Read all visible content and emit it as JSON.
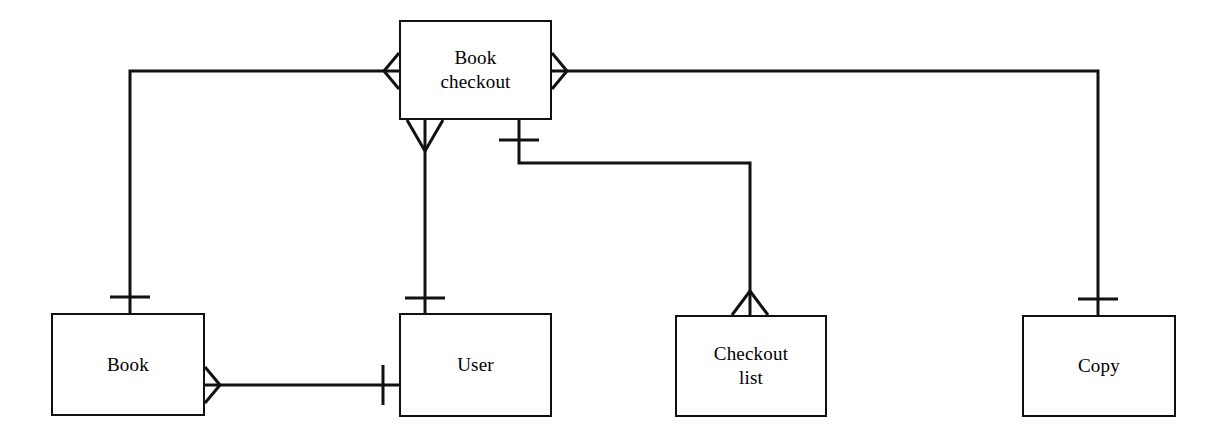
{
  "diagram": {
    "type": "entity-relationship-diagram",
    "notation": "crow's foot",
    "canvas": {
      "width": 1221,
      "height": 444,
      "background": "#ffffff"
    },
    "stroke_color": "#111111",
    "text_color": "#000000",
    "entities": [
      {
        "id": "book-checkout",
        "label": "Book\ncheckout",
        "x": 399,
        "y": 20,
        "width": 153,
        "height": 100
      },
      {
        "id": "book",
        "label": "Book",
        "x": 51,
        "y": 313,
        "width": 154,
        "height": 103
      },
      {
        "id": "user",
        "label": "User",
        "x": 399,
        "y": 313,
        "width": 153,
        "height": 104
      },
      {
        "id": "checkout-list",
        "label": "Checkout\nlist",
        "x": 675,
        "y": 315,
        "width": 152,
        "height": 102
      },
      {
        "id": "copy",
        "label": "Copy",
        "x": 1022,
        "y": 315,
        "width": 154,
        "height": 102
      }
    ],
    "relationships": [
      {
        "id": "book-checkout-to-book",
        "from": "book-checkout",
        "to": "book",
        "from_cardinality": "many",
        "to_cardinality": "one",
        "path": "left-side of Book checkout, across to x=130, down to top of Book"
      },
      {
        "id": "book-checkout-to-copy",
        "from": "book-checkout",
        "to": "copy",
        "from_cardinality": "many",
        "to_cardinality": "one",
        "path": "right-side of Book checkout, across to x=1098, down to top of Copy"
      },
      {
        "id": "book-checkout-to-user",
        "from": "book-checkout",
        "to": "user",
        "from_cardinality": "many",
        "to_cardinality": "one",
        "path": "bottom of Book checkout straight down to top of User"
      },
      {
        "id": "book-checkout-to-checkout-list",
        "from": "book-checkout",
        "to": "checkout-list",
        "from_cardinality": "one",
        "to_cardinality": "many",
        "path": "bottom of Book checkout down, right to x=750, down to top of Checkout list"
      },
      {
        "id": "book-to-user",
        "from": "book",
        "to": "user",
        "from_cardinality": "many",
        "to_cardinality": "one",
        "path": "right side of Book horizontally to left side of User"
      }
    ]
  }
}
